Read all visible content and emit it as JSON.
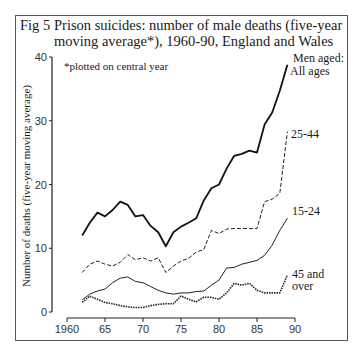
{
  "figure": {
    "number": "Fig 5",
    "title_line1": "Prison suicides: number of male deaths (five-year",
    "title_line2": "moving average*), 1960-90, England and Wales",
    "note": "*plotted on central year",
    "legend_header": "Men aged:"
  },
  "chart_data": {
    "type": "line",
    "title": "Prison suicides: number of male deaths (five-year moving average*), 1960-90, England and Wales",
    "subtitle": "*plotted on central year",
    "xlabel": "",
    "ylabel": "Number of deaths (five-year moving average)",
    "xlim": [
      1960,
      1990
    ],
    "ylim": [
      0,
      40
    ],
    "x_ticks": [
      1960,
      1965,
      1970,
      1975,
      1980,
      1985,
      1990
    ],
    "x_tick_labels": [
      "1960",
      "65",
      "70",
      "75",
      "80",
      "85",
      "90"
    ],
    "y_ticks": [
      0,
      10,
      20,
      30,
      40
    ],
    "y_tick_labels": [
      "0",
      "10",
      "20",
      "30",
      "40"
    ],
    "grid": false,
    "legend_title": "Men aged:",
    "x": [
      1962,
      1963,
      1964,
      1965,
      1966,
      1967,
      1968,
      1969,
      1970,
      1971,
      1972,
      1973,
      1974,
      1975,
      1976,
      1977,
      1978,
      1979,
      1980,
      1981,
      1982,
      1983,
      1984,
      1985,
      1986,
      1987,
      1988,
      1989
    ],
    "series": [
      {
        "name": "All ages",
        "style": "solid-thick",
        "values": [
          12.0,
          14.0,
          15.6,
          15.0,
          16.0,
          17.3,
          16.8,
          15.0,
          15.2,
          13.5,
          12.5,
          10.3,
          12.5,
          13.4,
          14.0,
          14.7,
          17.5,
          19.4,
          20.0,
          22.5,
          24.5,
          24.8,
          25.3,
          25.0,
          29.4,
          31.3,
          34.7,
          38.8
        ]
      },
      {
        "name": "25-44",
        "style": "dashed",
        "values": [
          6.2,
          7.5,
          8.0,
          7.5,
          7.2,
          7.8,
          9.0,
          8.2,
          8.5,
          8.0,
          8.5,
          6.2,
          7.2,
          8.0,
          8.4,
          9.4,
          9.8,
          12.8,
          12.3,
          13.0,
          13.1,
          13.1,
          13.1,
          13.1,
          17.3,
          17.7,
          18.6,
          28.3
        ]
      },
      {
        "name": "15-24",
        "style": "solid-thin",
        "values": [
          1.9,
          2.8,
          3.3,
          3.6,
          4.6,
          5.3,
          5.5,
          4.8,
          4.6,
          4.0,
          3.4,
          3.0,
          2.8,
          3.0,
          3.0,
          3.2,
          3.3,
          4.2,
          5.0,
          6.9,
          7.0,
          7.5,
          7.8,
          8.1,
          8.9,
          10.5,
          12.8,
          14.7
        ]
      },
      {
        "name": "45 and over",
        "style": "dotted",
        "values": [
          1.5,
          2.5,
          2.0,
          1.5,
          1.3,
          1.0,
          0.8,
          0.7,
          0.7,
          1.0,
          1.2,
          1.3,
          1.3,
          2.5,
          2.0,
          1.6,
          2.3,
          2.3,
          2.0,
          3.0,
          4.5,
          4.2,
          4.5,
          3.4,
          3.0,
          3.0,
          3.0,
          5.8
        ]
      }
    ],
    "series_labels": [
      "All ages",
      "25-44",
      "15-24",
      "45 and over"
    ]
  }
}
